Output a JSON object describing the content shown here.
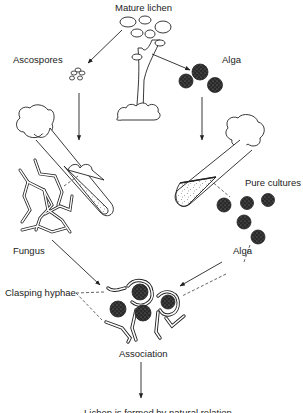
{
  "figure": {
    "type": "life-cycle diagram",
    "colors": {
      "ink": "#222222",
      "background": "#ffffff"
    }
  },
  "labels": {
    "mature_lichen": "Mature lichen",
    "ascospores": "Ascospores",
    "alga_top": "Alga",
    "pure_cultures": "Pure cultures",
    "fungus": "Fungus",
    "alga_bottom": "Alga",
    "clasping_hyphae": "Clasping hyphae",
    "association": "Association",
    "bottom_caption_partial": "Lichen is formed by natural relation"
  },
  "flow": [
    {
      "from": "Mature lichen",
      "to": "Ascospores"
    },
    {
      "from": "Mature lichen",
      "to": "Alga"
    },
    {
      "from": "Ascospores",
      "to": "Fungus culture tube"
    },
    {
      "from": "Alga",
      "to": "Alga culture tube"
    },
    {
      "from": "Fungus",
      "to": "Association"
    },
    {
      "from": "Alga",
      "to": "Association"
    },
    {
      "from": "Association",
      "to": "bottom caption (cut off)"
    }
  ]
}
